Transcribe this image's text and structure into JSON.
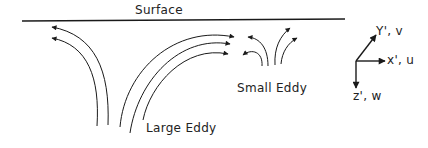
{
  "diagram": {
    "surface_label": "Surface",
    "large_eddy_label": "Large Eddy",
    "small_eddy_label": "Small Eddy",
    "axes": {
      "y_label": "Y', v",
      "x_label": "x', u",
      "z_label": "z', w"
    },
    "colors": {
      "line": "#1a1a1a",
      "background": "#ffffff"
    }
  }
}
